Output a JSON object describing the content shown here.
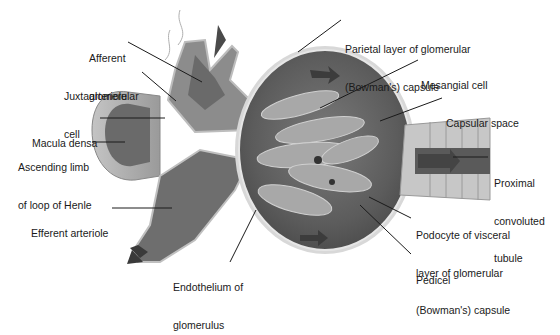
{
  "diagram": {
    "colors": {
      "background": "#ffffff",
      "capsule_dark": "#5e5e5e",
      "capsule_mid": "#8a8a8a",
      "capsule_light": "#c8c8c8",
      "tubule_light": "#b5b5b5",
      "leader_line": "#1a1a1a",
      "text": "#1a1a1a"
    },
    "labels": [
      {
        "id": "afferent-arteriole",
        "lines": [
          "Afferent",
          "arteriole"
        ]
      },
      {
        "id": "juxtaglomerular-cell",
        "lines": [
          "Juxtaglomerular",
          "cell"
        ]
      },
      {
        "id": "macula-densa",
        "lines": [
          "Macula densa"
        ]
      },
      {
        "id": "ascending-limb",
        "lines": [
          "Ascending limb",
          "of loop of Henle"
        ]
      },
      {
        "id": "efferent-arteriole",
        "lines": [
          "Efferent arteriole"
        ]
      },
      {
        "id": "endothelium",
        "lines": [
          "Endothelium of",
          "glomerulus"
        ]
      },
      {
        "id": "parietal-layer",
        "lines": [
          "Parietal layer of glomerular",
          "(Bowman's) capsule"
        ]
      },
      {
        "id": "mesangial-cell",
        "lines": [
          "Mesangial cell"
        ]
      },
      {
        "id": "capsular-space",
        "lines": [
          "Capsular space"
        ]
      },
      {
        "id": "proximal-tubule",
        "lines": [
          "Proximal",
          "convoluted",
          "tubule"
        ]
      },
      {
        "id": "podocyte",
        "lines": [
          "Podocyte of visceral",
          "layer of glomerular",
          "(Bowman's) capsule"
        ]
      },
      {
        "id": "pedicel",
        "lines": [
          "Pedicel"
        ]
      }
    ]
  }
}
